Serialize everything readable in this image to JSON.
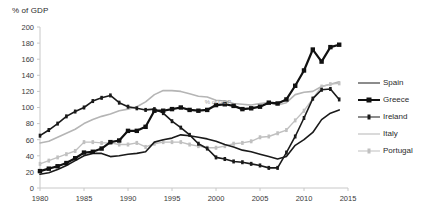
{
  "chart_data": {
    "type": "line",
    "title": "% of GDP",
    "xlabel": "",
    "ylabel": "% of GDP",
    "xlim": [
      1980,
      2015
    ],
    "ylim": [
      0,
      200
    ],
    "ytick_step": 20,
    "xtick_step": 5,
    "grid": false,
    "legend_position": "right",
    "watermark": "% of GDP",
    "yticks": [
      "0",
      "20",
      "40",
      "60",
      "80",
      "100",
      "120",
      "140",
      "160",
      "180",
      "200"
    ],
    "xticks": [
      "1980",
      "1985",
      "1990",
      "1995",
      "2000",
      "2005",
      "2010",
      "2015"
    ],
    "x": [
      1980,
      1981,
      1982,
      1983,
      1984,
      1985,
      1986,
      1987,
      1988,
      1989,
      1990,
      1991,
      1992,
      1993,
      1994,
      1995,
      1996,
      1997,
      1998,
      1999,
      2000,
      2001,
      2002,
      2003,
      2004,
      2005,
      2006,
      2007,
      2008,
      2009,
      2010,
      2011,
      2012,
      2013,
      2014
    ],
    "series": [
      {
        "name": "Spain",
        "color": "#1a1a1a",
        "marker": "none",
        "width": 1.6,
        "values": [
          17,
          19,
          23,
          28,
          34,
          40,
          43,
          43,
          39,
          40,
          42,
          43,
          45,
          57,
          60,
          62,
          66,
          65,
          63,
          61,
          58,
          54,
          51,
          47,
          45,
          42,
          39,
          36,
          39,
          53,
          60,
          69,
          85,
          93,
          97
        ]
      },
      {
        "name": "Greece",
        "color": "#111111",
        "marker": "square",
        "width": 2.2,
        "values": [
          21,
          24,
          27,
          31,
          37,
          44,
          45,
          49,
          57,
          59,
          71,
          71,
          76,
          96,
          96,
          98,
          100,
          97,
          96,
          97,
          103,
          104,
          102,
          98,
          99,
          101,
          106,
          105,
          110,
          127,
          146,
          172,
          157,
          175,
          178
        ]
      },
      {
        "name": "Ireland",
        "color": "#1a1a1a",
        "marker": "dash",
        "width": 1.6,
        "values": [
          65,
          72,
          80,
          89,
          95,
          100,
          108,
          112,
          115,
          106,
          101,
          99,
          97,
          98,
          93,
          83,
          75,
          66,
          55,
          49,
          38,
          36,
          33,
          32,
          30,
          28,
          25,
          25,
          44,
          64,
          87,
          111,
          122,
          123,
          110
        ]
      },
      {
        "name": "Italy",
        "color": "#b5b5b5",
        "marker": "none",
        "width": 1.6,
        "values": [
          56,
          58,
          63,
          68,
          73,
          80,
          85,
          89,
          92,
          96,
          98,
          101,
          107,
          116,
          121,
          121,
          120,
          117,
          114,
          113,
          109,
          108,
          105,
          104,
          103,
          105,
          106,
          103,
          106,
          116,
          119,
          120,
          126,
          129,
          132
        ]
      },
      {
        "name": "Portugal",
        "color": "#c0c0c0",
        "marker": "dash",
        "width": 1.4,
        "values": [
          30,
          34,
          38,
          42,
          46,
          57,
          57,
          56,
          56,
          54,
          54,
          56,
          51,
          55,
          57,
          57,
          57,
          54,
          52,
          50,
          50,
          52,
          55,
          56,
          58,
          63,
          64,
          68,
          72,
          84,
          96,
          111,
          126,
          129,
          130
        ]
      }
    ]
  },
  "legend": {
    "items": [
      {
        "label": "Spain",
        "color": "#1a1a1a",
        "marker": "none"
      },
      {
        "label": "Greece",
        "color": "#111111",
        "marker": "square"
      },
      {
        "label": "Ireland",
        "color": "#1a1a1a",
        "marker": "dash"
      },
      {
        "label": "Italy",
        "color": "#b5b5b5",
        "marker": "none"
      },
      {
        "label": "Portugal",
        "color": "#c0c0c0",
        "marker": "dash"
      }
    ]
  },
  "axes": {
    "axis_color": "#c8c8c8",
    "tick_text_color": "#3a3a3a"
  }
}
